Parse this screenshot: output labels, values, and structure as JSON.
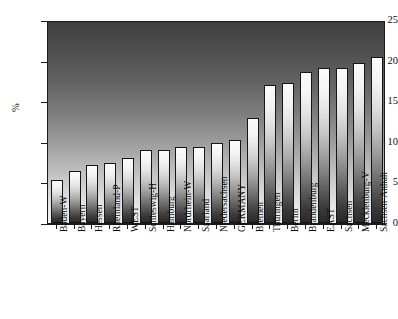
{
  "chart_data": {
    "type": "bar",
    "title": "",
    "xlabel": "",
    "ylabel": "%",
    "ylim": [
      0,
      25
    ],
    "yticks": [
      0,
      5,
      10,
      15,
      20,
      25
    ],
    "ytick_labels": [
      "0",
      "5",
      "10",
      "15",
      "20",
      "25"
    ],
    "grid": false,
    "legend": "none",
    "orientation": "vertical",
    "categories": [
      "Baden-W",
      "Bayern",
      "Hessen",
      "Rheinland-P",
      "WEST",
      "Schleswig-H",
      "Hamburg",
      "Nordrhein-W",
      "Saarland",
      "Niedersachsen",
      "GERMANY",
      "Bremen",
      "Thüringen",
      "Berlin",
      "Brandenburg",
      "EAST",
      "Sachsen",
      "Mecklenburg-V",
      "Sachsen-Anhalt"
    ],
    "values": [
      5.3,
      6.4,
      7.1,
      7.4,
      8.0,
      9.0,
      9.0,
      9.3,
      9.3,
      9.8,
      10.2,
      12.9,
      17.0,
      17.2,
      18.6,
      19.1,
      19.1,
      19.7,
      20.5
    ]
  },
  "style": {
    "bar_edge_color": "#151515",
    "axis_color": "#1a1a1a",
    "text_color": "#0d0d0d",
    "background_top_color": "#3f3f3f",
    "background_bottom_color": "#f1f1f1",
    "bar_top_color": "#fbfbfb",
    "bar_bottom_color": "#2a2a2a"
  }
}
